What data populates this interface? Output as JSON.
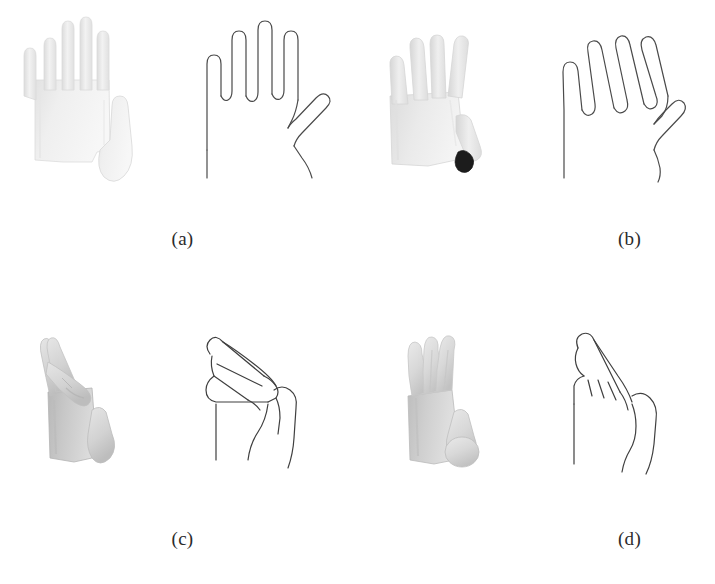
{
  "figure": {
    "background_color": "#ffffff",
    "layout": "2x2 grid of hand-pose panels",
    "panels": [
      {
        "id": "a",
        "label": "(a)",
        "render": {
          "name": "grayscale-hand-render-a",
          "description": "open flat hand, palm facing viewer, four fingers extended upward, thumb extended to the right",
          "fill_color": "#ededed",
          "edge_color": "#d4d4d4",
          "accent_color": "#ffffff"
        },
        "outline": {
          "name": "line-drawing-hand-a",
          "description": "open flat hand contour, four fingers up, thumb out to the right",
          "stroke_color": "#4a4a4a",
          "stroke_width": 1.2
        }
      },
      {
        "id": "b",
        "label": "(b)",
        "render": {
          "name": "grayscale-hand-render-b",
          "description": "open hand rotated, fingers splayed, thumb down-right with dark shaded fingertip",
          "fill_color": "#e3e3e3",
          "edge_color": "#c9c9c9",
          "accent_color": "#1a1a1a"
        },
        "outline": {
          "name": "line-drawing-hand-b",
          "description": "rotated open hand contour with splayed fingers and lowered thumb",
          "stroke_color": "#4a4a4a",
          "stroke_width": 1.2
        }
      },
      {
        "id": "c",
        "label": "(c)",
        "render": {
          "name": "grayscale-hand-render-c",
          "description": "side view, fingers folded forward toward thumb, thumb bulging out to the right",
          "fill_color": "#c8c8c8",
          "edge_color": "#a8a8a8",
          "accent_color": "#eeeeee"
        },
        "outline": {
          "name": "line-drawing-hand-c",
          "description": "side-view hand contour, fingers bent forward, thumb separated",
          "stroke_color": "#3f3f3f",
          "stroke_width": 1.2
        }
      },
      {
        "id": "d",
        "label": "(d)",
        "render": {
          "name": "grayscale-hand-render-d",
          "description": "side view, fingers angled upward and slightly curled, thumb rounded at lower right",
          "fill_color": "#cfcfcf",
          "edge_color": "#ababab",
          "accent_color": "#efefef"
        },
        "outline": {
          "name": "line-drawing-hand-d",
          "description": "side-view hand contour, fingers angled up with curl creases, thumb at right",
          "stroke_color": "#3f3f3f",
          "stroke_width": 1.2
        }
      }
    ]
  }
}
